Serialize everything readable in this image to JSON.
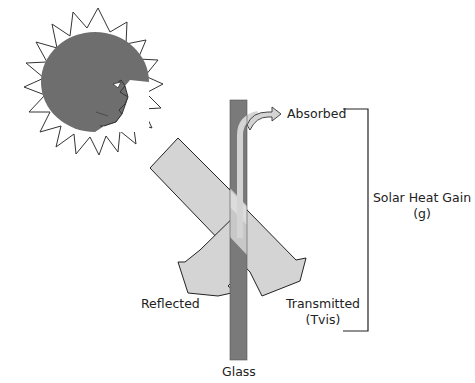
{
  "diagram": {
    "labels": {
      "absorbed": "Absorbed",
      "reflected": "Reflected",
      "transmitted_line1": "Transmitted",
      "transmitted_line2": "(Tvis)",
      "solar_heat_gain_line1": "Solar Heat Gain",
      "solar_heat_gain_line2": "(g)",
      "glass": "Glass"
    },
    "icons": {
      "sun": "sun-face-icon"
    },
    "colors": {
      "glass": "#7a7a7a",
      "beam": "#d4d4d4",
      "sun_face": "#6e6e6e",
      "outline": "#222222"
    }
  }
}
